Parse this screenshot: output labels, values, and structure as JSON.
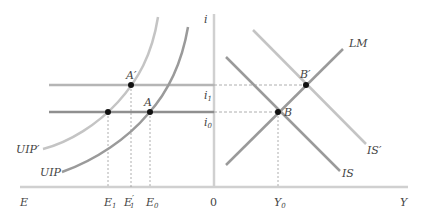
{
  "diagram": {
    "type": "economics-graph",
    "panels": [
      "foreign-exchange-market",
      "IS-LM"
    ],
    "axes": {
      "horizontal_left_label": "E",
      "horizontal_right_label": "Y",
      "vertical_label": "i",
      "origin_label": "0"
    },
    "interest_levels": {
      "i1": {
        "label": "i",
        "subscript": "1"
      },
      "i0": {
        "label": "i",
        "subscript": "0"
      }
    },
    "exchange_rate_ticks": {
      "E1": {
        "label": "E",
        "subscript": "1",
        "prime": ""
      },
      "E1p": {
        "label": "E",
        "subscript": "1",
        "prime": "′"
      },
      "E0": {
        "label": "E",
        "subscript": "0",
        "prime": ""
      }
    },
    "output_ticks": {
      "Y0": {
        "label": "Y",
        "subscript": "0"
      }
    },
    "curves": {
      "uip_prime": {
        "label": "UIP′",
        "color": "#c4c4c4"
      },
      "uip": {
        "label": "UIP",
        "color": "#9a9a9a"
      },
      "lm": {
        "label": "LM",
        "color": "#9a9a9a"
      },
      "is": {
        "label": "IS",
        "color": "#9a9a9a"
      },
      "is_prime": {
        "label": "IS′",
        "color": "#c4c4c4"
      },
      "i1_line_color": "#b5b5b5",
      "i0_line_color": "#8f8f8f"
    },
    "points": {
      "A_prime": {
        "label": "A′"
      },
      "A": {
        "label": "A"
      },
      "B_prime": {
        "label": "B′"
      },
      "B": {
        "label": "B"
      }
    },
    "colors": {
      "axis": "#d0d0d0",
      "dashed": "#999999",
      "point": "#111111",
      "text": "#444444"
    }
  }
}
